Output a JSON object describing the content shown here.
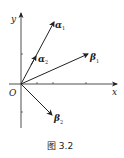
{
  "figure": {
    "caption": "图 3.2",
    "axes": {
      "x_label": "x",
      "y_label": "y",
      "origin_label": "O"
    },
    "vectors": [
      {
        "name": "alpha1",
        "symbol": "α",
        "subscript": "1",
        "label": "α1",
        "style": "bold-italic"
      },
      {
        "name": "alpha2",
        "symbol": "α",
        "subscript": "2",
        "label": "α2",
        "style": "bold-italic"
      },
      {
        "name": "beta1",
        "symbol": "β",
        "subscript": "1",
        "label": "β1",
        "style": "bold-italic"
      },
      {
        "name": "beta2",
        "symbol": "β",
        "subscript": "2",
        "label": "β2",
        "style": "bold-italic"
      }
    ],
    "colors": {
      "stroke": "#222222",
      "background": "#ffffff"
    }
  }
}
